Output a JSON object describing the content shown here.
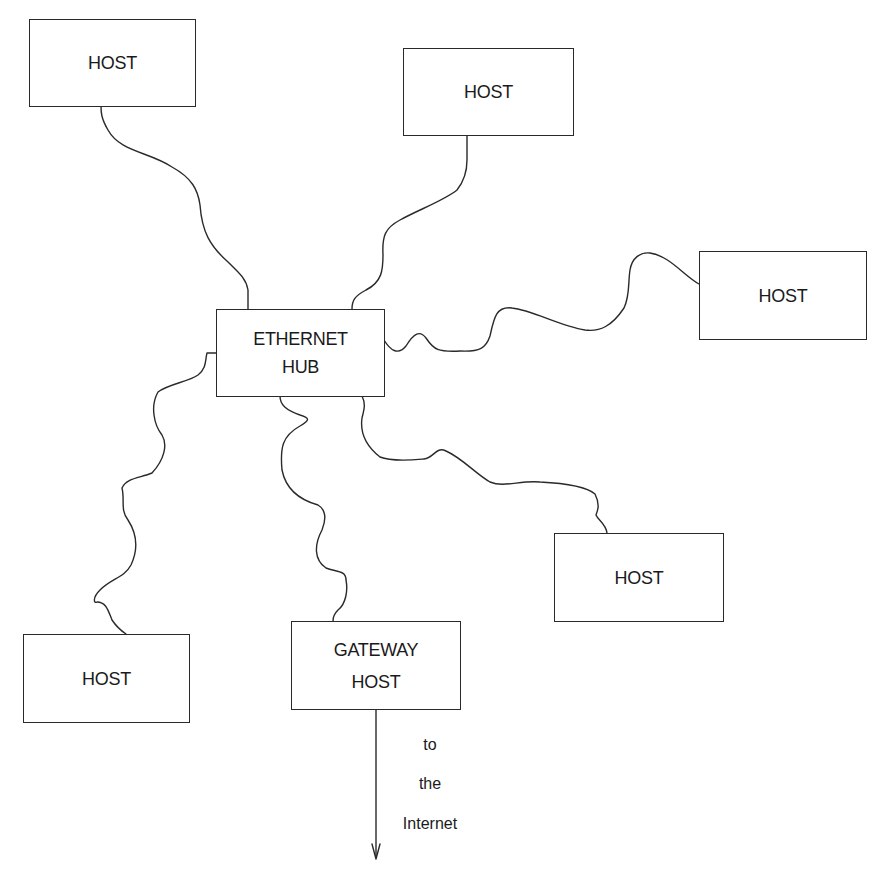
{
  "diagram": {
    "type": "network-topology",
    "hub": {
      "lines": [
        "ETHERNET",
        "HUB"
      ]
    },
    "hosts": [
      {
        "id": "host-top-left",
        "label": "HOST"
      },
      {
        "id": "host-top-right",
        "label": "HOST"
      },
      {
        "id": "host-right",
        "label": "HOST"
      },
      {
        "id": "host-bottom-right",
        "label": "HOST"
      },
      {
        "id": "host-bottom-left",
        "label": "HOST"
      }
    ],
    "gateway": {
      "lines": [
        "GATEWAY",
        "HOST"
      ]
    },
    "uplink_caption": [
      "to",
      "the",
      "Internet"
    ],
    "connections": [
      [
        "hub",
        "host-top-left"
      ],
      [
        "hub",
        "host-top-right"
      ],
      [
        "hub",
        "host-right"
      ],
      [
        "hub",
        "host-bottom-right"
      ],
      [
        "hub",
        "host-bottom-left"
      ],
      [
        "hub",
        "gateway"
      ],
      [
        "gateway",
        "internet"
      ]
    ],
    "colors": {
      "stroke": "#2a2a2a",
      "background": "#ffffff",
      "text": "#1a1a1a"
    }
  }
}
